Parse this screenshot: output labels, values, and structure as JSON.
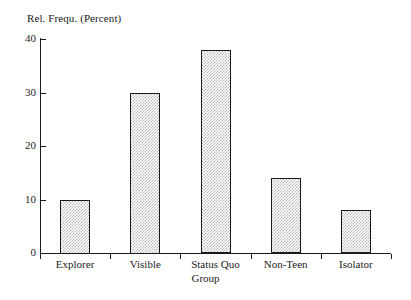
{
  "chart_data": {
    "type": "bar",
    "title": "",
    "xlabel": "Group",
    "ylabel": "Rel. Frequ. (Percent)",
    "categories": [
      "Explorer",
      "Visible",
      "Status Quo",
      "Non-Teen",
      "Isolator"
    ],
    "values": [
      10,
      30,
      38,
      14,
      8
    ],
    "ylim": [
      0,
      40
    ],
    "yticks": [
      0,
      10,
      20,
      30,
      40
    ],
    "ytick_labels": [
      "0",
      "10",
      "20",
      "30",
      "40"
    ],
    "grid": false,
    "legend": null,
    "bar_fill": "#b9b9b9",
    "bar_edge": "#1a1a1a",
    "axis_color": "#1a1a1a",
    "background": "#ffffff"
  },
  "axes": {
    "y_title": "Rel. Frequ. (Percent)",
    "x_title": "Group"
  }
}
